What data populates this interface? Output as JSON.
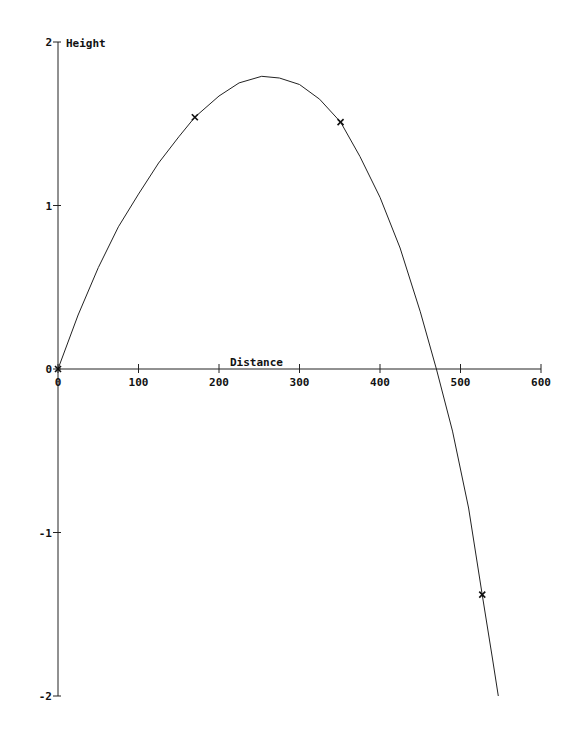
{
  "chart_data": {
    "type": "line",
    "title": "",
    "xlabel": "Distance",
    "ylabel": "Height",
    "xlim": [
      0,
      600
    ],
    "ylim": [
      -2,
      2
    ],
    "x_ticks": [
      0,
      100,
      200,
      300,
      400,
      500,
      600
    ],
    "x_tick_labels": [
      "0",
      "100",
      "200",
      "300",
      "400",
      "500",
      "600"
    ],
    "y_ticks": [
      -2,
      -1,
      0,
      1,
      2
    ],
    "y_tick_labels": [
      "-2",
      "-1",
      "0",
      "1",
      "2"
    ],
    "grid": false,
    "legend": null,
    "series": [
      {
        "name": "trajectory",
        "style": "line",
        "color": "#222222",
        "x": [
          0,
          25,
          50,
          75,
          100,
          125,
          150,
          170,
          200,
          225,
          253,
          275,
          300,
          325,
          351,
          375,
          400,
          425,
          450,
          470,
          490,
          510,
          527,
          540,
          547
        ],
        "y": [
          0,
          0.33,
          0.62,
          0.87,
          1.07,
          1.26,
          1.42,
          1.54,
          1.67,
          1.75,
          1.79,
          1.78,
          1.74,
          1.65,
          1.51,
          1.3,
          1.05,
          0.74,
          0.35,
          0,
          -0.38,
          -0.85,
          -1.38,
          -1.78,
          -2.0
        ]
      },
      {
        "name": "observations",
        "style": "markers",
        "marker": "x",
        "color": "#111111",
        "x": [
          0,
          170,
          351,
          527
        ],
        "y": [
          0,
          1.54,
          1.51,
          -1.38
        ]
      }
    ]
  }
}
